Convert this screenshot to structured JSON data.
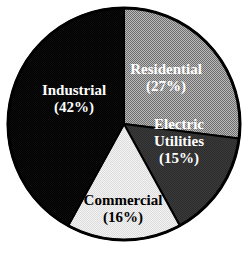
{
  "chart_data": {
    "type": "pie",
    "title": "",
    "subtitle": "",
    "xlabel": "",
    "ylabel": "",
    "legend_position": "none",
    "grid": false,
    "labels_inside_slices": true,
    "total_percent": 100,
    "categories": [
      "Residential",
      "Electric Utilities",
      "Commercial",
      "Industrial"
    ],
    "values": [
      27,
      15,
      16,
      42
    ],
    "value_unit": "%",
    "slices": [
      {
        "name": "Residential",
        "label": "Residential",
        "value": 27,
        "value_text": "(27%)",
        "label_lines": [
          "Residential",
          "(27%)"
        ],
        "color": "#9a9a9a",
        "pattern": "checkerboard-50",
        "text_color": "#ffffff",
        "start_angle_deg": 0,
        "end_angle_deg": 97.2,
        "label_x": 166,
        "label_y": 82
      },
      {
        "name": "Electric Utilities",
        "label": "Electric Utilities",
        "value": 15,
        "value_text": "(15%)",
        "label_lines": [
          "Electric",
          "Utilities",
          "(15%)"
        ],
        "color": "#3a3a3a",
        "pattern": "solid",
        "text_color": "#ffffff",
        "start_angle_deg": 97.2,
        "end_angle_deg": 151.2,
        "label_x": 179,
        "label_y": 146
      },
      {
        "name": "Commercial",
        "label": "Commercial",
        "value": 16,
        "value_text": "(16%)",
        "label_lines": [
          "Commercial",
          "(16%)"
        ],
        "color": "#e9e9e9",
        "pattern": "checkerboard-light",
        "text_color": "#000000",
        "start_angle_deg": 151.2,
        "end_angle_deg": 208.8,
        "label_x": 123,
        "label_y": 213
      },
      {
        "name": "Industrial",
        "label": "Industrial",
        "value": 42,
        "value_text": "(42%)",
        "label_lines": [
          "Industrial",
          "(42%)"
        ],
        "color": "#0d0d0d",
        "pattern": "solid",
        "text_color": "#ffffff",
        "start_angle_deg": 208.8,
        "end_angle_deg": 360,
        "label_x": 74,
        "label_y": 103
      }
    ],
    "geometry": {
      "center_x": 124,
      "center_y": 124,
      "radius": 116,
      "start_at_twelve_oclock": true,
      "direction": "clockwise"
    },
    "colors": {
      "background": "#ffffff",
      "outline": "#000000",
      "residential": "#9a9a9a",
      "electric_utilities": "#3a3a3a",
      "commercial": "#e9e9e9",
      "industrial": "#0d0d0d"
    }
  }
}
